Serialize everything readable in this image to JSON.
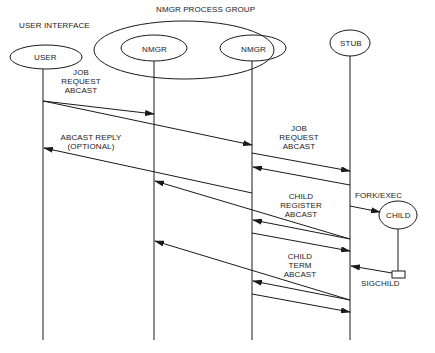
{
  "title": "NMGR PROCESS GROUP",
  "group_labels": {
    "user_interface": "USER INTERFACE",
    "process_group": "NMGR PROCESS GROUP"
  },
  "participants": [
    {
      "id": "user",
      "label": "USER"
    },
    {
      "id": "nmgr1",
      "label": "NMGR"
    },
    {
      "id": "nmgr2",
      "label": "NMGR"
    },
    {
      "id": "stub",
      "label": "STUB"
    },
    {
      "id": "child",
      "label": "CHILD"
    }
  ],
  "messages": {
    "job_request_1": [
      "JOB",
      "REQUEST",
      "ABCAST"
    ],
    "abcast_reply": [
      "ABCAST REPLY",
      "(OPTIONAL)"
    ],
    "job_request_2": [
      "JOB",
      "REQUEST",
      "ABCAST"
    ],
    "fork_exec": "FORK/EXEC",
    "child_register": [
      "CHILD",
      "REGISTER",
      "ABCAST"
    ],
    "child_term": [
      "CHILD",
      "TERM",
      "ABCAST"
    ],
    "sigchild": "SIGCHILD"
  },
  "arrows": [
    {
      "from": "user",
      "to": "nmgr1",
      "label": "JOB REQUEST ABCAST"
    },
    {
      "from": "user",
      "to": "nmgr2",
      "label": "JOB REQUEST ABCAST"
    },
    {
      "from": "nmgr2",
      "to": "stub",
      "label": "JOB REQUEST ABCAST"
    },
    {
      "from": "stub",
      "to": "nmgr2",
      "label": "JOB REQUEST ABCAST"
    },
    {
      "from": "nmgr2",
      "to": "user",
      "label": "ABCAST REPLY (OPTIONAL)"
    },
    {
      "from": "stub",
      "to": "child",
      "label": "FORK/EXEC"
    },
    {
      "from": "stub",
      "to": "nmgr1",
      "label": "CHILD REGISTER ABCAST"
    },
    {
      "from": "stub",
      "to": "nmgr2",
      "label": "CHILD REGISTER ABCAST"
    },
    {
      "from": "nmgr2",
      "to": "stub",
      "label": "CHILD REGISTER ABCAST"
    },
    {
      "from": "child",
      "to": "stub",
      "label": "SIGCHILD"
    },
    {
      "from": "stub",
      "to": "nmgr1",
      "label": "CHILD TERM ABCAST"
    },
    {
      "from": "stub",
      "to": "nmgr2",
      "label": "CHILD TERM ABCAST"
    },
    {
      "from": "nmgr2",
      "to": "stub",
      "label": "CHILD TERM ABCAST"
    }
  ]
}
